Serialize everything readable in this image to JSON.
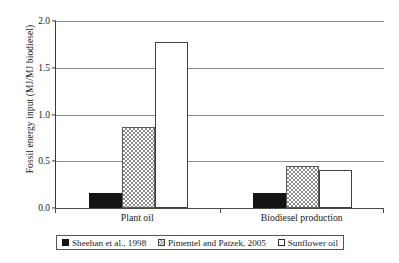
{
  "chart_data": {
    "type": "bar",
    "title": "",
    "xlabel": "",
    "ylabel": "Fossil energy input (MJ/MJ biodiesel)",
    "categories": [
      "Plant oil",
      "Biodiesel production"
    ],
    "series": [
      {
        "name": "Sheehan et al., 1998",
        "values": [
          0.16,
          0.16
        ],
        "style": "solid-black"
      },
      {
        "name": "Pimentel and Patzek, 2005",
        "values": [
          0.87,
          0.45
        ],
        "style": "grey-checker"
      },
      {
        "name": "Sunflower oil",
        "values": [
          1.78,
          0.41
        ],
        "style": "open-white"
      }
    ],
    "ylim": [
      0.0,
      2.0
    ],
    "ytick_labels": [
      "0.0",
      "0.5",
      "1.0",
      "1.5",
      "2.0"
    ],
    "ytick_values": [
      0.0,
      0.5,
      1.0,
      1.5,
      2.0
    ],
    "grid": "horizontal",
    "legend_position": "bottom"
  },
  "legend": {
    "items": [
      {
        "label": "Sheehan et al., 1998"
      },
      {
        "label": "Pimentel and Patzek, 2005"
      },
      {
        "label": "Sunflower oil"
      }
    ]
  },
  "colors": {
    "series_1": "#141414",
    "series_2": "#8a8a8a",
    "series_3": "#ffffff",
    "axis": "#3a3a3a",
    "gridline": "#8d8d8d",
    "text": "#1a1a1a"
  }
}
